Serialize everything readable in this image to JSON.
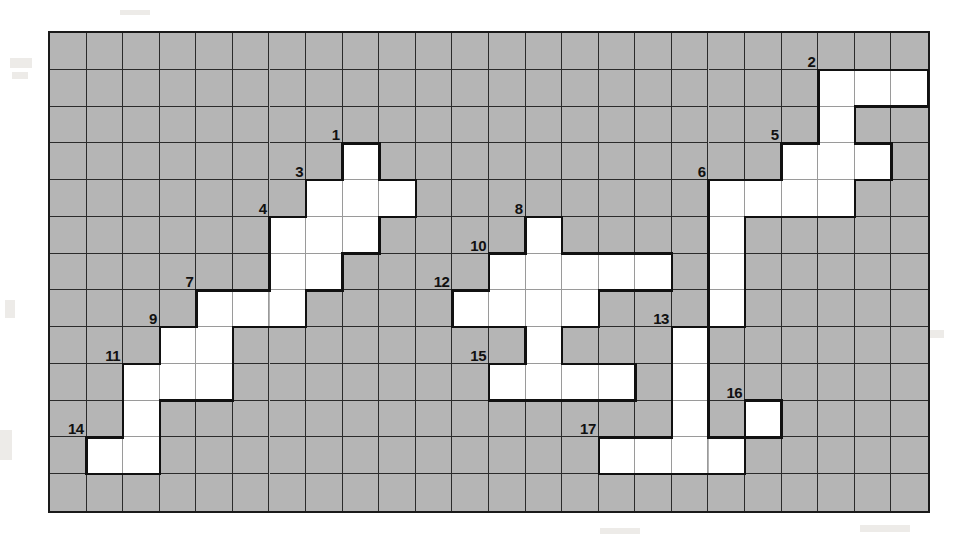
{
  "puzzle": {
    "title": "Numbered Crossword Grid",
    "type": "crossword-grid",
    "columns": 24,
    "rows": 13,
    "colors": {
      "blocked_cell": "#b5b5b5",
      "open_cell": "#ffffff",
      "grid_line": "#2b2b2b",
      "outline": "#111111",
      "clue_number": "#111111",
      "page_background": "#ffffff"
    },
    "open_cells": [
      {
        "r": 1,
        "c": 21
      },
      {
        "r": 1,
        "c": 22
      },
      {
        "r": 1,
        "c": 23
      },
      {
        "r": 2,
        "c": 21
      },
      {
        "r": 3,
        "c": 8
      },
      {
        "r": 3,
        "c": 20
      },
      {
        "r": 3,
        "c": 21
      },
      {
        "r": 3,
        "c": 22
      },
      {
        "r": 4,
        "c": 7
      },
      {
        "r": 4,
        "c": 8
      },
      {
        "r": 4,
        "c": 9
      },
      {
        "r": 4,
        "c": 18
      },
      {
        "r": 4,
        "c": 19
      },
      {
        "r": 4,
        "c": 20
      },
      {
        "r": 4,
        "c": 21
      },
      {
        "r": 5,
        "c": 6
      },
      {
        "r": 5,
        "c": 7
      },
      {
        "r": 5,
        "c": 8
      },
      {
        "r": 5,
        "c": 13
      },
      {
        "r": 5,
        "c": 18
      },
      {
        "r": 6,
        "c": 6
      },
      {
        "r": 6,
        "c": 7
      },
      {
        "r": 6,
        "c": 12
      },
      {
        "r": 6,
        "c": 13
      },
      {
        "r": 6,
        "c": 14
      },
      {
        "r": 6,
        "c": 15
      },
      {
        "r": 6,
        "c": 16
      },
      {
        "r": 6,
        "c": 18
      },
      {
        "r": 7,
        "c": 4
      },
      {
        "r": 7,
        "c": 5
      },
      {
        "r": 7,
        "c": 6
      },
      {
        "r": 7,
        "c": 11
      },
      {
        "r": 7,
        "c": 12
      },
      {
        "r": 7,
        "c": 13
      },
      {
        "r": 7,
        "c": 14
      },
      {
        "r": 7,
        "c": 18
      },
      {
        "r": 8,
        "c": 3
      },
      {
        "r": 8,
        "c": 4
      },
      {
        "r": 8,
        "c": 13
      },
      {
        "r": 8,
        "c": 17
      },
      {
        "r": 9,
        "c": 2
      },
      {
        "r": 9,
        "c": 3
      },
      {
        "r": 9,
        "c": 4
      },
      {
        "r": 9,
        "c": 12
      },
      {
        "r": 9,
        "c": 13
      },
      {
        "r": 9,
        "c": 14
      },
      {
        "r": 9,
        "c": 15
      },
      {
        "r": 9,
        "c": 17
      },
      {
        "r": 10,
        "c": 2
      },
      {
        "r": 10,
        "c": 17
      },
      {
        "r": 10,
        "c": 19
      },
      {
        "r": 11,
        "c": 1
      },
      {
        "r": 11,
        "c": 2
      },
      {
        "r": 11,
        "c": 15
      },
      {
        "r": 11,
        "c": 16
      },
      {
        "r": 11,
        "c": 17
      },
      {
        "r": 11,
        "c": 18
      }
    ],
    "clues": [
      {
        "number": "1",
        "r": 3,
        "c": 8
      },
      {
        "number": "2",
        "r": 1,
        "c": 21
      },
      {
        "number": "3",
        "r": 4,
        "c": 7
      },
      {
        "number": "4",
        "r": 5,
        "c": 6
      },
      {
        "number": "5",
        "r": 3,
        "c": 20
      },
      {
        "number": "6",
        "r": 4,
        "c": 18
      },
      {
        "number": "7",
        "r": 7,
        "c": 4
      },
      {
        "number": "8",
        "r": 5,
        "c": 13
      },
      {
        "number": "9",
        "r": 8,
        "c": 3
      },
      {
        "number": "10",
        "r": 6,
        "c": 12
      },
      {
        "number": "11",
        "r": 9,
        "c": 2
      },
      {
        "number": "12",
        "r": 7,
        "c": 11
      },
      {
        "number": "13",
        "r": 8,
        "c": 17
      },
      {
        "number": "14",
        "r": 11,
        "c": 1
      },
      {
        "number": "15",
        "r": 9,
        "c": 12
      },
      {
        "number": "16",
        "r": 10,
        "c": 19
      },
      {
        "number": "17",
        "r": 11,
        "c": 15
      }
    ]
  }
}
